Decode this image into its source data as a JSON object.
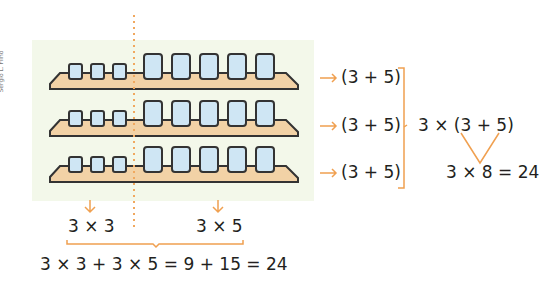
{
  "credit": "Sergio L. Filho",
  "shelves": [
    {
      "small_glasses": 3,
      "large_glasses": 5
    },
    {
      "small_glasses": 3,
      "large_glasses": 5
    },
    {
      "small_glasses": 3,
      "large_glasses": 5
    }
  ],
  "right": {
    "row_labels": [
      "(3 + 5)",
      "(3 + 5)",
      "(3 + 5)"
    ],
    "grouped": "3 × (3 + 5)",
    "result": "3 × 8 = 24"
  },
  "bottom": {
    "left_label": "3 × 3",
    "right_label": "3 × 5",
    "total": "3 × 3 + 3 × 5 = 9 + 15 = 24"
  },
  "colors": {
    "accent": "#f0a050",
    "panel": "#f3f8ea",
    "shelf": "#f2d2a6",
    "glass": "#cfe6f4",
    "outline": "#333333"
  }
}
